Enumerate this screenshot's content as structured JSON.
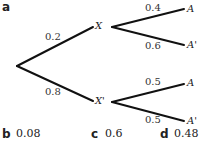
{
  "diagram": {
    "part_label": "a",
    "nodes": {
      "x": "X",
      "x_prime": "X'",
      "a_upper": "A",
      "a_prime_upper": "A'",
      "a_lower": "A",
      "a_prime_lower": "A'"
    },
    "branches": {
      "root_to_x": "0.2",
      "root_to_x_prime": "0.8",
      "x_to_a": "0.4",
      "x_to_a_prime": "0.6",
      "x_prime_to_a": "0.5",
      "x_prime_to_a_prime": "0.5"
    },
    "line_color": "#111111"
  },
  "answers": [
    {
      "label": "b",
      "value": "0.08"
    },
    {
      "label": "c",
      "value": "0.6"
    },
    {
      "label": "d",
      "value": "0.48"
    }
  ]
}
